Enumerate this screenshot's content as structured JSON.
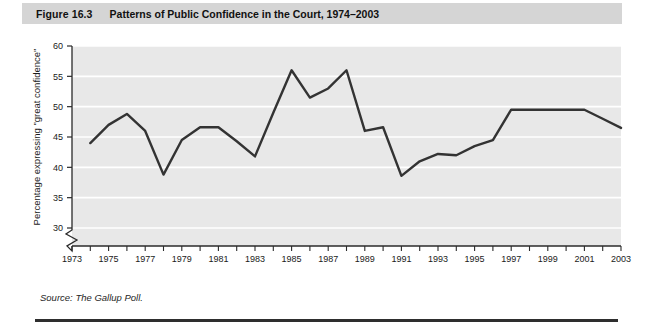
{
  "figure": {
    "number": "Figure 16.3",
    "title": "Patterns of Public Confidence in the Court, 1974–2003",
    "source": "Source: The Gallup Poll."
  },
  "chart_data": {
    "type": "line",
    "title": "Patterns of Public Confidence in the Court, 1974–2003",
    "xlabel": "",
    "ylabel": "Percentage expressing  \"great confidence\"",
    "xlim": [
      1973,
      2003
    ],
    "ylim": [
      28,
      60
    ],
    "y_axis_break": true,
    "y_ticks": [
      30,
      35,
      40,
      45,
      50,
      55,
      60
    ],
    "x_ticks": [
      1973,
      1974,
      1975,
      1976,
      1977,
      1978,
      1979,
      1980,
      1981,
      1982,
      1983,
      1984,
      1985,
      1986,
      1987,
      1988,
      1989,
      1990,
      1991,
      1992,
      1993,
      1994,
      1995,
      1996,
      1997,
      1998,
      1999,
      2000,
      2001,
      2002,
      2003
    ],
    "x_tick_labels": [
      1973,
      1975,
      1977,
      1979,
      1981,
      1983,
      1985,
      1987,
      1989,
      1991,
      1993,
      1995,
      1997,
      1999,
      2001,
      2003
    ],
    "grid": "horizontal",
    "grid_color": "#ffffff",
    "plot_background": "#e8e8e8",
    "line_color": "#333333",
    "line_width": 2.4,
    "x": [
      1974,
      1975,
      1976,
      1977,
      1978,
      1979,
      1980,
      1981,
      1982,
      1983,
      1984,
      1985,
      1986,
      1987,
      1988,
      1989,
      1990,
      1991,
      1992,
      1993,
      1994,
      1995,
      1996,
      1997,
      1998,
      1999,
      2000,
      2001,
      2002,
      2003
    ],
    "values": [
      44,
      47,
      48.8,
      46,
      38.8,
      44.5,
      46.6,
      46.6,
      44.3,
      41.8,
      49,
      56,
      51.5,
      53,
      56,
      46,
      46.6,
      38.6,
      41,
      42.2,
      42,
      43.5,
      44.5,
      49.5,
      49.5,
      49.5,
      49.5,
      49.5,
      48,
      46.5
    ]
  },
  "axis_labels": {
    "y_tick_30": "30",
    "y_tick_35": "35",
    "y_tick_40": "40",
    "y_tick_45": "45",
    "y_tick_50": "50",
    "y_tick_55": "55",
    "y_tick_60": "60",
    "x_tick_1973": "1973",
    "x_tick_1975": "1975",
    "x_tick_1977": "1977",
    "x_tick_1979": "1979",
    "x_tick_1981": "1981",
    "x_tick_1983": "1983",
    "x_tick_1985": "1985",
    "x_tick_1987": "1987",
    "x_tick_1989": "1989",
    "x_tick_1991": "1991",
    "x_tick_1993": "1993",
    "x_tick_1995": "1995",
    "x_tick_1997": "1997",
    "x_tick_1999": "1999",
    "x_tick_2001": "2001",
    "x_tick_2003": "2003"
  }
}
